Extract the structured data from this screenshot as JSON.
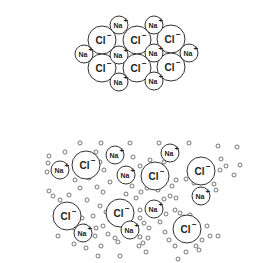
{
  "figure": {
    "colors": {
      "stroke": "#333333",
      "text": "#222222",
      "background": "#ffffff",
      "water": "#555555"
    }
  },
  "labels": {
    "chloride": "Cl",
    "chloride_charge": "−",
    "sodium": "Na",
    "sodium_charge": "+"
  },
  "lattice": {
    "chloride_radius": 14,
    "sodium_radius": 9,
    "chloride_ions": [
      {
        "x": 102,
        "y": 40
      },
      {
        "x": 137,
        "y": 40
      },
      {
        "x": 171,
        "y": 39
      },
      {
        "x": 102,
        "y": 68
      },
      {
        "x": 137,
        "y": 68
      },
      {
        "x": 171,
        "y": 67
      }
    ],
    "sodium_ions": [
      {
        "x": 119,
        "y": 25
      },
      {
        "x": 154,
        "y": 25
      },
      {
        "x": 84,
        "y": 54
      },
      {
        "x": 119,
        "y": 55
      },
      {
        "x": 154,
        "y": 53
      },
      {
        "x": 189,
        "y": 53
      },
      {
        "x": 119,
        "y": 82
      },
      {
        "x": 154,
        "y": 81
      }
    ]
  },
  "solution": {
    "chloride_radius": 14,
    "sodium_radius": 9,
    "chloride_ions": [
      {
        "x": 86,
        "y": 165
      },
      {
        "x": 155,
        "y": 176
      },
      {
        "x": 201,
        "y": 171
      },
      {
        "x": 67,
        "y": 216
      },
      {
        "x": 120,
        "y": 213
      },
      {
        "x": 187,
        "y": 229
      }
    ],
    "sodium_ions": [
      {
        "x": 60,
        "y": 170
      },
      {
        "x": 115,
        "y": 155
      },
      {
        "x": 126,
        "y": 175
      },
      {
        "x": 170,
        "y": 153
      },
      {
        "x": 201,
        "y": 196
      },
      {
        "x": 154,
        "y": 209
      },
      {
        "x": 83,
        "y": 233
      },
      {
        "x": 130,
        "y": 230
      }
    ],
    "water_molecules": [
      [
        80,
        143
      ],
      [
        101,
        143
      ],
      [
        130,
        143
      ],
      [
        159,
        143
      ],
      [
        189,
        143
      ],
      [
        218,
        146
      ],
      [
        237,
        147
      ],
      [
        49,
        156
      ],
      [
        65,
        152
      ],
      [
        96,
        152
      ],
      [
        100,
        162
      ],
      [
        48,
        163
      ],
      [
        104,
        170
      ],
      [
        140,
        166
      ],
      [
        150,
        160
      ],
      [
        133,
        157
      ],
      [
        164,
        162
      ],
      [
        221,
        159
      ],
      [
        226,
        166
      ],
      [
        240,
        165
      ],
      [
        47,
        172
      ],
      [
        75,
        180
      ],
      [
        89,
        178
      ],
      [
        110,
        182
      ],
      [
        97,
        187
      ],
      [
        103,
        192
      ],
      [
        80,
        188
      ],
      [
        172,
        186
      ],
      [
        176,
        180
      ],
      [
        186,
        179
      ],
      [
        194,
        183
      ],
      [
        147,
        188
      ],
      [
        141,
        192
      ],
      [
        136,
        198
      ],
      [
        126,
        194
      ],
      [
        132,
        186
      ],
      [
        158,
        190
      ],
      [
        170,
        196
      ],
      [
        164,
        199
      ],
      [
        176,
        198
      ],
      [
        214,
        184
      ],
      [
        216,
        190
      ],
      [
        220,
        170
      ],
      [
        49,
        191
      ],
      [
        53,
        196
      ],
      [
        60,
        200
      ],
      [
        69,
        195
      ],
      [
        87,
        200
      ],
      [
        100,
        206
      ],
      [
        106,
        212
      ],
      [
        111,
        205
      ],
      [
        93,
        216
      ],
      [
        78,
        212
      ],
      [
        82,
        218
      ],
      [
        85,
        226
      ],
      [
        60,
        225
      ],
      [
        58,
        236
      ],
      [
        74,
        228
      ],
      [
        96,
        228
      ],
      [
        103,
        226
      ],
      [
        95,
        236
      ],
      [
        110,
        220
      ],
      [
        140,
        210
      ],
      [
        140,
        218
      ],
      [
        144,
        223
      ],
      [
        160,
        222
      ],
      [
        166,
        214
      ],
      [
        175,
        210
      ],
      [
        180,
        213
      ],
      [
        184,
        217
      ],
      [
        190,
        215
      ],
      [
        197,
        222
      ],
      [
        207,
        226
      ],
      [
        210,
        236
      ],
      [
        202,
        240
      ],
      [
        196,
        246
      ],
      [
        186,
        252
      ],
      [
        175,
        246
      ],
      [
        169,
        240
      ],
      [
        165,
        232
      ],
      [
        149,
        228
      ],
      [
        148,
        238
      ],
      [
        143,
        243
      ],
      [
        139,
        246
      ],
      [
        118,
        242
      ],
      [
        115,
        238
      ],
      [
        108,
        234
      ],
      [
        101,
        246
      ],
      [
        86,
        248
      ],
      [
        74,
        244
      ],
      [
        98,
        256
      ],
      [
        120,
        256
      ],
      [
        146,
        252
      ],
      [
        178,
        259
      ],
      [
        199,
        250
      ],
      [
        218,
        236
      ],
      [
        234,
        175
      ],
      [
        140,
        237
      ]
    ],
    "water_radius": 2
  }
}
